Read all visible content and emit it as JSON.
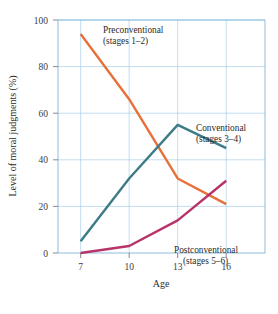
{
  "chart_data": {
    "type": "line",
    "title": "",
    "xlabel": "Age",
    "ylabel": "Level of moral judgments (%)",
    "x": [
      7,
      10,
      13,
      16
    ],
    "xticklabels": [
      "7",
      "10",
      "13",
      "16"
    ],
    "yticklabels": [
      "0",
      "20",
      "40",
      "60",
      "80",
      "100"
    ],
    "yticks": [
      0,
      20,
      40,
      60,
      80,
      100
    ],
    "ylim": [
      0,
      100
    ],
    "xlim": [
      5.6,
      18.4
    ],
    "grid": true,
    "legend_position": "inline-annotations",
    "series": [
      {
        "name": "Preconventional (stages 1–2)",
        "label_line1": "Preconventional",
        "label_line2": "(stages 1–2)",
        "color": "#E8703A",
        "values": [
          94,
          66,
          32,
          21
        ]
      },
      {
        "name": "Conventional (stages 3–4)",
        "label_line1": "Conventional",
        "label_line2": "(stages 3–4)",
        "color": "#3D7C87",
        "values": [
          5,
          32,
          55,
          45
        ]
      },
      {
        "name": "Postconventional (stages 5–6)",
        "label_line1": "Postconventional",
        "label_line2": "(stages 5–6)",
        "color": "#B8336A",
        "values": [
          0,
          3,
          14,
          31
        ]
      }
    ]
  },
  "axes": {
    "x_title": "Age",
    "y_title": "Level of moral judgments (%)",
    "x_ticks": [
      "7",
      "10",
      "13",
      "16"
    ],
    "y_ticks": [
      "100",
      "80",
      "60",
      "40",
      "20",
      "0"
    ]
  },
  "annotations": {
    "preconventional_line1": "Preconventional",
    "preconventional_line2": "(stages 1–2)",
    "conventional_line1": "Conventional",
    "conventional_line2": "(stages 3–4)",
    "postconventional_line1": "Postconventional",
    "postconventional_line2": "(stages 5–6)"
  },
  "colors": {
    "preconventional": "#E8703A",
    "conventional": "#3D7C87",
    "postconventional": "#B8336A",
    "grid": "#a8cfe8",
    "background": "#ffffff"
  }
}
